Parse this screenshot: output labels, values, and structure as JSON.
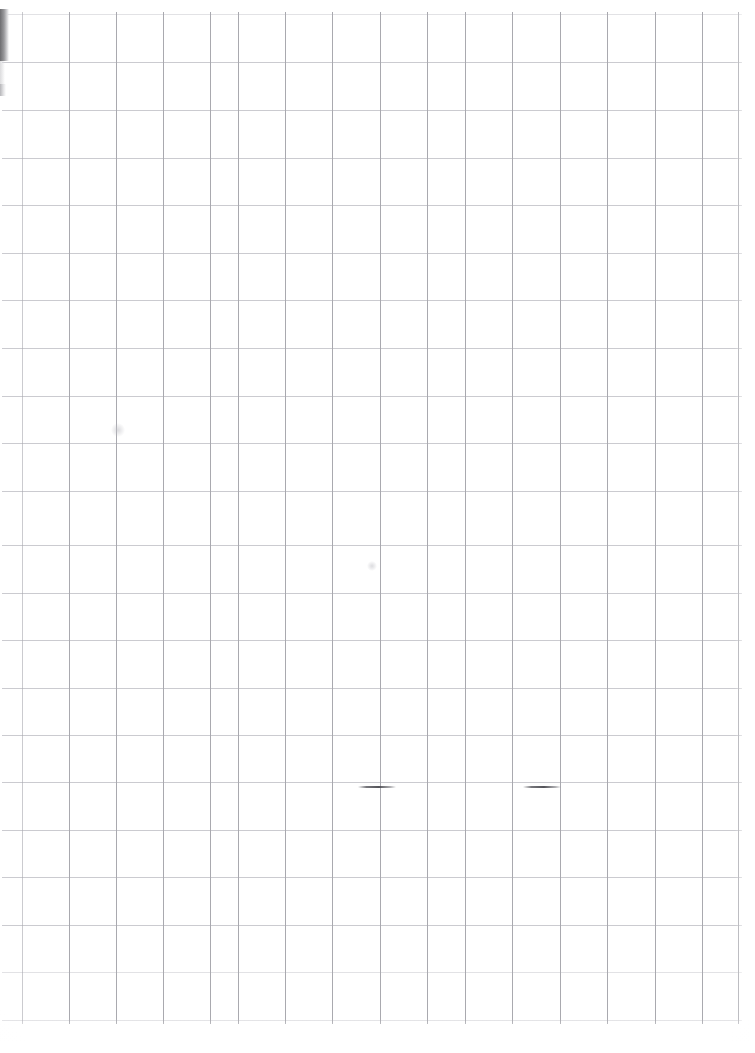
{
  "document": {
    "type": "scanned-grid-paper",
    "title": "Scanned graph paper sheet",
    "description": "A blank sheet of quadrille / graph paper captured by a flatbed scanner.",
    "width_px": 755,
    "height_px": 1053,
    "background_color": "#ffffff",
    "content_text": ""
  },
  "grid": {
    "label": "ruled square grid",
    "cell_size_px": 47.4,
    "origin_x_px": 22,
    "origin_y_px": 14,
    "horizontal_line_color": "#cbcbd0",
    "vertical_line_color": "#a9a9af",
    "horizontal_line_count": 22,
    "vertical_line_count": 16,
    "horizontal_line_y": [
      14,
      62,
      110,
      158,
      205,
      253,
      300,
      348,
      396,
      443,
      491,
      545,
      593,
      640,
      688,
      735,
      782,
      830,
      877,
      925,
      972,
      1020
    ],
    "vertical_line_x": [
      22,
      69,
      116,
      163,
      210,
      238,
      285,
      332,
      380,
      427,
      465,
      512,
      560,
      607,
      655,
      702,
      738
    ],
    "line_extent": {
      "left_px": 2,
      "right_px": 742,
      "top_px": 12,
      "bottom_px": 1024
    }
  },
  "artifacts": {
    "label": "scan artifacts",
    "edge_shadow": {
      "name": "left-edge-scan-shadow",
      "x_px": 0,
      "y_px": 9,
      "width_px": 9,
      "height_px": 52,
      "color": "#6d6d70"
    },
    "pen_marks": [
      {
        "name": "pen-mark-left",
        "x_px": 358,
        "y_px": 786,
        "width_px": 38,
        "color": "#4a4a50"
      },
      {
        "name": "pen-mark-right",
        "x_px": 523,
        "y_px": 786,
        "width_px": 38,
        "color": "#4a4a50"
      }
    ],
    "smudges": [
      {
        "name": "smudge-upper-left",
        "x_px": 118,
        "y_px": 430,
        "size_px": 14
      },
      {
        "name": "smudge-mid",
        "x_px": 372,
        "y_px": 566,
        "size_px": 10
      }
    ]
  }
}
